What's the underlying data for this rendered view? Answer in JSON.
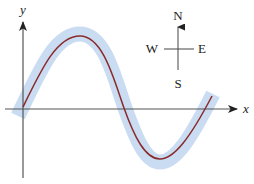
{
  "diagram": {
    "axes": {
      "x_label": "x",
      "y_label": "y"
    },
    "compass": {
      "north": "N",
      "south": "S",
      "east": "E",
      "west": "W"
    },
    "curve": {
      "description": "sinusoidal wave with highlighted band",
      "line_color": "#8b2a2a",
      "band_color": "#c9dcf2"
    },
    "colors": {
      "axis": "#444444",
      "text": "#222222"
    }
  }
}
